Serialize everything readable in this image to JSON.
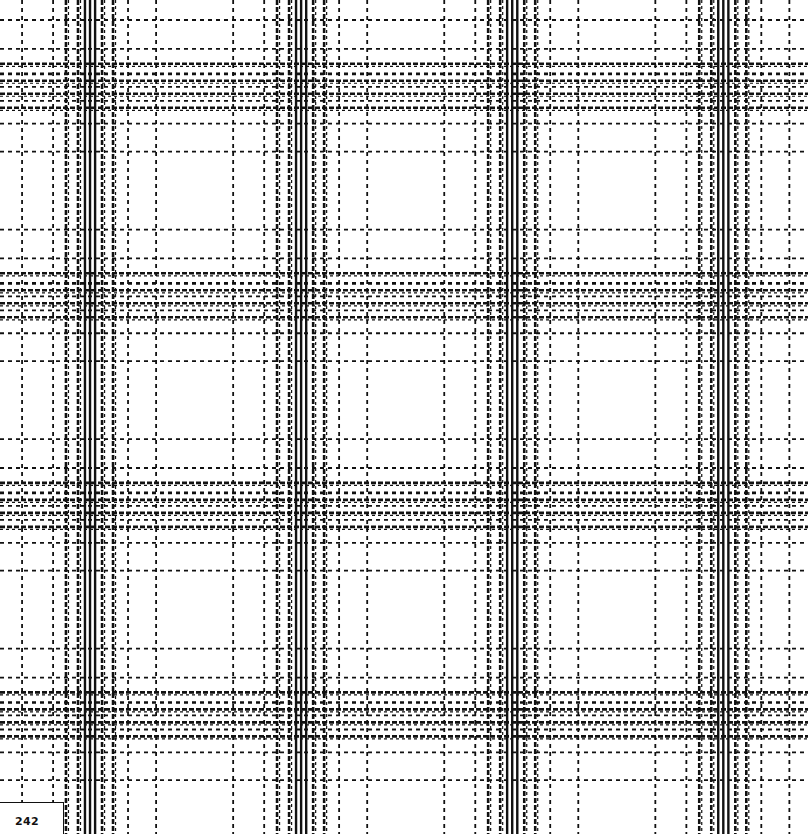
{
  "page": {
    "page_number": "242"
  },
  "colors": {
    "background": "#ffffff",
    "thread": "#111111"
  },
  "pattern": {
    "type": "plaid",
    "repeats_horizontal": 4,
    "repeats_vertical": 4,
    "sett_warp": [
      {
        "offset": 0.114,
        "weight": "thin",
        "style": "dashed"
      },
      {
        "offset": 0.261,
        "weight": "thin",
        "style": "dashed"
      },
      {
        "offset": 0.322,
        "weight": "medium",
        "style": "twill"
      },
      {
        "offset": 0.379,
        "weight": "medium",
        "style": "twill"
      },
      {
        "offset": 0.412,
        "weight": "bold",
        "style": "solid"
      },
      {
        "offset": 0.436,
        "weight": "bold",
        "style": "solid"
      },
      {
        "offset": 0.46,
        "weight": "bold",
        "style": "solid"
      },
      {
        "offset": 0.493,
        "weight": "medium",
        "style": "twill"
      },
      {
        "offset": 0.545,
        "weight": "medium",
        "style": "twill"
      },
      {
        "offset": 0.616,
        "weight": "thin",
        "style": "dashed"
      },
      {
        "offset": 0.749,
        "weight": "thin",
        "style": "dashed"
      }
    ],
    "sett_weft": [
      {
        "offset": 0.124,
        "weight": "thin",
        "style": "dashed"
      },
      {
        "offset": 0.262,
        "weight": "thin",
        "style": "dashed"
      },
      {
        "offset": 0.333,
        "weight": "medium",
        "style": "twill"
      },
      {
        "offset": 0.381,
        "weight": "medium",
        "style": "dashed"
      },
      {
        "offset": 0.414,
        "weight": "medium",
        "style": "twill"
      },
      {
        "offset": 0.443,
        "weight": "thin",
        "style": "dashed"
      },
      {
        "offset": 0.476,
        "weight": "medium",
        "style": "twill"
      },
      {
        "offset": 0.51,
        "weight": "thin",
        "style": "dashed"
      },
      {
        "offset": 0.543,
        "weight": "medium",
        "style": "twill"
      },
      {
        "offset": 0.619,
        "weight": "thin",
        "style": "dashed"
      },
      {
        "offset": 0.752,
        "weight": "thin",
        "style": "dashed"
      }
    ]
  }
}
